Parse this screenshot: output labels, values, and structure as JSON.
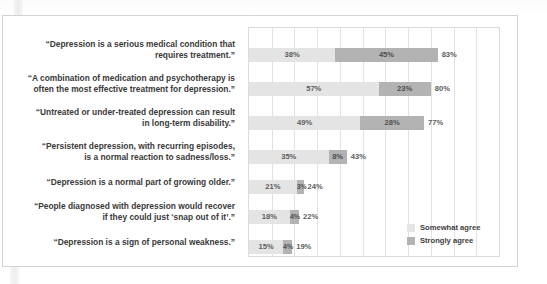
{
  "figure": {
    "legend": {
      "items": [
        {
          "label": "Somewhat agree",
          "color": "#e4e4e4",
          "key": "somewhat"
        },
        {
          "label": "Strongly agree",
          "color": "#b3b3b3",
          "key": "strongly"
        }
      ]
    }
  },
  "chart_data": {
    "type": "bar",
    "orientation": "horizontal",
    "stacked": true,
    "title": "",
    "xlabel": "",
    "ylabel": "",
    "xlim": [
      0,
      110
    ],
    "grid": true,
    "legend_position": "inside-right-bottom",
    "categories": [
      "“Depression is a serious medical condition that requires treatment.”",
      "“A combination of medication and psychotherapy is often the most effective treatment for depression.”",
      "“Untreated or under-treated depression can result in long-term disability.”",
      "“Persistent depression, with recurring episodes, is a normal reaction to sadness/loss.”",
      "“Depression is a normal part of growing older.”",
      "“People diagnosed with depression would recover if they could just ‘snap out of it’.”",
      "“Depression is a sign of personal weakness.”"
    ],
    "series": [
      {
        "name": "Somewhat agree",
        "color": "#e4e4e4",
        "values": [
          38,
          57,
          49,
          35,
          21,
          18,
          15
        ]
      },
      {
        "name": "Strongly agree",
        "color": "#b3b3b3",
        "values": [
          45,
          23,
          28,
          8,
          3,
          4,
          4
        ]
      }
    ],
    "totals": [
      83,
      80,
      77,
      43,
      24,
      22,
      19
    ],
    "rows": [
      {
        "label_line1": "“Depression is a serious medical condition that",
        "label_line2": "requires treatment.”",
        "somewhat": 38,
        "strongly": 45,
        "total": 83,
        "somewhat_text": "38%",
        "strongly_text": "45%",
        "total_text": "83%"
      },
      {
        "label_line1": "“A combination of medication and psychotherapy is",
        "label_line2": "often the most effective treatment for depression.”",
        "somewhat": 57,
        "strongly": 23,
        "total": 80,
        "somewhat_text": "57%",
        "strongly_text": "23%",
        "total_text": "80%"
      },
      {
        "label_line1": "“Untreated or under-treated depression can result",
        "label_line2": "in long-term disability.”",
        "somewhat": 49,
        "strongly": 28,
        "total": 77,
        "somewhat_text": "49%",
        "strongly_text": "28%",
        "total_text": "77%"
      },
      {
        "label_line1": "“Persistent depression, with recurring episodes,",
        "label_line2": "is a normal reaction to sadness/loss.”",
        "somewhat": 35,
        "strongly": 8,
        "total": 43,
        "somewhat_text": "35%",
        "strongly_text": "8%",
        "total_text": "43%"
      },
      {
        "label_line1": "“Depression is a normal part of growing older.”",
        "label_line2": "",
        "somewhat": 21,
        "strongly": 3,
        "total": 24,
        "somewhat_text": "21%",
        "strongly_text": "3%",
        "total_text": "24%"
      },
      {
        "label_line1": "“People diagnosed with depression would recover",
        "label_line2": "if they could just ‘snap out of it’.”",
        "somewhat": 18,
        "strongly": 4,
        "total": 22,
        "somewhat_text": "18%",
        "strongly_text": "4%",
        "total_text": "22%"
      },
      {
        "label_line1": "“Depression is a sign of personal weakness.”",
        "label_line2": "",
        "somewhat": 15,
        "strongly": 4,
        "total": 19,
        "somewhat_text": "15%",
        "strongly_text": "4%",
        "total_text": "19%"
      }
    ]
  }
}
